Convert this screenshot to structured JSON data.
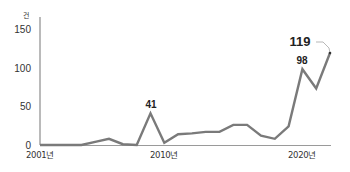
{
  "chart_data": {
    "type": "line",
    "title": "",
    "xlabel": "",
    "ylabel": "건",
    "unit": "건",
    "ylim": [
      0,
      150
    ],
    "yticks": [
      0,
      50,
      100,
      150
    ],
    "x_tick_labels": [
      "2001년",
      "2010년",
      "2020년"
    ],
    "grid": false,
    "legend": null,
    "x": [
      2001,
      2002,
      2003,
      2004,
      2005,
      2006,
      2007,
      2008,
      2009,
      2010,
      2011,
      2012,
      2013,
      2014,
      2015,
      2016,
      2017,
      2018,
      2019,
      2020,
      2021,
      2022
    ],
    "series": [
      {
        "name": "건수",
        "values": [
          0,
          0,
          0,
          0,
          4,
          8,
          1,
          0,
          41,
          3,
          14,
          15,
          17,
          17,
          26,
          26,
          12,
          8,
          24,
          98,
          73,
          119
        ]
      }
    ],
    "annotations": [
      {
        "x": 2009,
        "value": 41,
        "label": "41"
      },
      {
        "x": 2020,
        "value": 98,
        "label": "98"
      },
      {
        "x": 2022,
        "value": 119,
        "label": "119",
        "emphasis": true
      }
    ],
    "colors": {
      "line": "#7a7a7a",
      "axis": "#8c8c8c",
      "text": "#333333"
    }
  }
}
